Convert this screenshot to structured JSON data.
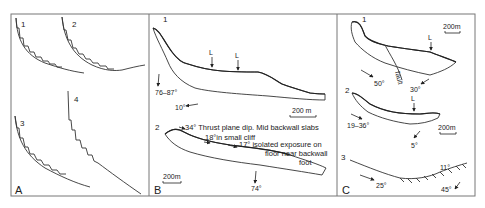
{
  "figure": {
    "panels": [
      {
        "letter": "A",
        "profiles": [
          {
            "label": "1"
          },
          {
            "label": "2"
          },
          {
            "label": "3"
          },
          {
            "label": "4"
          }
        ]
      },
      {
        "letter": "B",
        "section1": {
          "label": "1",
          "markers": [
            "L",
            "L"
          ],
          "dip_range": "76–87°",
          "dip_low": "10°",
          "scale": "200 m"
        },
        "section2": {
          "label": "2",
          "annotations": {
            "thrust": "34° Thrust plane dip. Mid backwall slabs",
            "cliff": "18°in small cliff",
            "isolated": "17° isolated exposure on",
            "floor": "floor near backwall",
            "foot": "foot",
            "dip_bottom": "74°"
          },
          "scale": "200m"
        }
      },
      {
        "letter": "C",
        "section1": {
          "label": "1",
          "marker": "L",
          "fault_label": "fault",
          "dip_left": "50°",
          "dip_right": "30°",
          "scale": "200m"
        },
        "section2": {
          "label": "2",
          "marker": "L",
          "dip_left": "19–36°",
          "dip_bottom": "5°",
          "scale": "200m"
        },
        "section3": {
          "label": "3",
          "dip_left": "25°",
          "dip_mid": "11°",
          "dip_right": "45°"
        }
      }
    ]
  }
}
